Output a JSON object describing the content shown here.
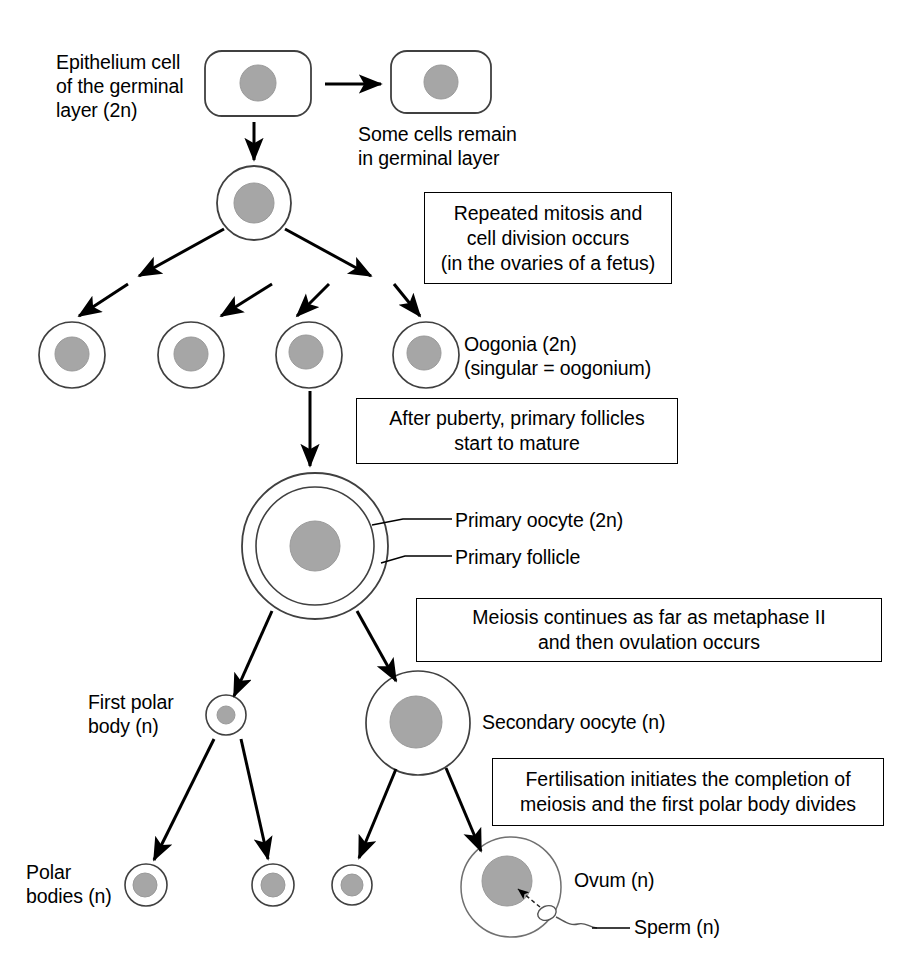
{
  "diagram": {
    "colors": {
      "nucleus_fill": "#a6a6a6",
      "nucleus_stroke": "#8f8f8f",
      "membrane_stroke": "#404040",
      "line": "#000000",
      "background": "#ffffff"
    }
  },
  "labels": {
    "epithelium_cell": "Epithelium cell\nof the germinal\nlayer (2n)",
    "some_cells_remain": "Some cells remain\nin germinal layer",
    "oogonia": "Oogonia (2n)\n(singular = oogonium)",
    "primary_oocyte": "Primary oocyte (2n)",
    "primary_follicle": "Primary follicle",
    "first_polar_body": "First polar\nbody (n)",
    "secondary_oocyte": "Secondary oocyte (n)",
    "polar_bodies": "Polar\nbodies (n)",
    "ovum": "Ovum (n)",
    "sperm": "Sperm (n)"
  },
  "notes": {
    "mitosis": "Repeated mitosis and\ncell division occurs\n(in the ovaries of a fetus)",
    "puberty": "After puberty, primary follicles\nstart to mature",
    "meiosis": "Meiosis continues as far as metaphase II\nand then ovulation occurs",
    "fertilisation": "Fertilisation initiates the completion of\nmeiosis and the first polar body divides"
  },
  "cells": {
    "epithelium_left": {
      "shape": "rounded-rect",
      "x": 205,
      "y": 51,
      "w": 106,
      "h": 65,
      "nucleus_r": 18
    },
    "epithelium_right": {
      "shape": "rounded-rect",
      "x": 391,
      "y": 51,
      "w": 100,
      "h": 62,
      "nucleus_r": 17
    },
    "stem_cell": {
      "shape": "circle",
      "cx": 254,
      "cy": 203,
      "r": 37,
      "nucleus_r": 20
    },
    "oogonia": [
      {
        "cx": 72,
        "cy": 355,
        "r": 33,
        "nucleus_r": 17
      },
      {
        "cx": 191,
        "cy": 355,
        "r": 33,
        "nucleus_r": 17
      },
      {
        "cx": 309,
        "cy": 355,
        "r": 33,
        "nucleus_r": 17
      },
      {
        "cx": 426,
        "cy": 355,
        "r": 33,
        "nucleus_r": 17
      }
    ],
    "primary_oocyte": {
      "cx": 315,
      "cy": 546,
      "r_outer": 73,
      "r_inner": 59,
      "nucleus_r": 25
    },
    "first_polar_body": {
      "cx": 226,
      "cy": 715,
      "r": 20,
      "nucleus_r": 9
    },
    "secondary_oocyte": {
      "cx": 418,
      "cy": 723,
      "r": 52,
      "nucleus_r": 26
    },
    "polar_bodies": [
      {
        "cx": 146,
        "cy": 885,
        "r": 21,
        "nucleus_r": 12
      },
      {
        "cx": 273,
        "cy": 885,
        "r": 21,
        "nucleus_r": 12
      },
      {
        "cx": 352,
        "cy": 885,
        "r": 20,
        "nucleus_r": 11
      }
    ],
    "ovum": {
      "cx": 511,
      "cy": 887,
      "r": 50,
      "nucleus_r": 25
    },
    "sperm": {
      "head_cx": 546,
      "head_cy": 913,
      "head_rx": 9,
      "head_ry": 7
    }
  },
  "arrows": [
    {
      "name": "epithelium-to-epithelium",
      "from": [
        325,
        84
      ],
      "to": [
        381,
        84
      ]
    },
    {
      "name": "epithelium-to-stem",
      "from": [
        254,
        120
      ],
      "to": [
        254,
        161
      ]
    },
    {
      "name": "stem-to-left",
      "from": [
        224,
        228
      ],
      "to": [
        138,
        275
      ]
    },
    {
      "name": "stem-to-right",
      "from": [
        285,
        228
      ],
      "to": [
        372,
        275
      ]
    },
    {
      "name": "left-to-oogonium-1",
      "from": [
        128,
        283
      ],
      "to": [
        78,
        316
      ]
    },
    {
      "name": "left-to-oogonium-2",
      "from": [
        273,
        283
      ],
      "to": [
        220,
        316
      ]
    },
    {
      "name": "right-to-oogonium-3",
      "from": [
        330,
        283
      ],
      "to": [
        296,
        316
      ]
    },
    {
      "name": "right-to-oogonium-4",
      "from": [
        394,
        283
      ],
      "to": [
        420,
        316
      ]
    },
    {
      "name": "oogonium-to-primary-oocyte",
      "from": [
        310,
        390
      ],
      "to": [
        310,
        466
      ]
    },
    {
      "name": "oocyte-to-first-polar-body",
      "from": [
        272,
        612
      ],
      "to": [
        233,
        697
      ]
    },
    {
      "name": "oocyte-to-secondary-oocyte",
      "from": [
        357,
        612
      ],
      "to": [
        395,
        682
      ]
    },
    {
      "name": "polarbody-to-pb1",
      "from": [
        215,
        738
      ],
      "to": [
        154,
        860
      ]
    },
    {
      "name": "polarbody-to-pb2",
      "from": [
        241,
        738
      ],
      "to": [
        268,
        860
      ]
    },
    {
      "name": "secondary-to-pb3",
      "from": [
        395,
        768
      ],
      "to": [
        358,
        858
      ]
    },
    {
      "name": "secondary-to-ovum",
      "from": [
        446,
        768
      ],
      "to": [
        480,
        852
      ]
    }
  ],
  "leader_lines": [
    {
      "name": "primary-oocyte-leader",
      "from": [
        372,
        524
      ],
      "to": [
        447,
        524
      ]
    },
    {
      "name": "primary-follicle-leader",
      "from": [
        380,
        561
      ],
      "to": [
        447,
        561
      ]
    },
    {
      "name": "sperm-leader",
      "from": [
        585,
        926
      ],
      "to": [
        628,
        926
      ]
    }
  ]
}
